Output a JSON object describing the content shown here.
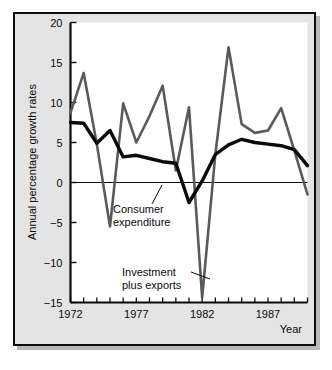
{
  "figure": {
    "background": "#ffffff",
    "panel_background": "#e4e4e4",
    "plot_background": "#ffffff",
    "frame_color": "#0d0d0d"
  },
  "chart_data": {
    "type": "line",
    "title": "",
    "xlabel": "Year",
    "ylabel": "Annual percentage growth rates",
    "xlim": [
      1972,
      1990
    ],
    "ylim": [
      -15,
      20
    ],
    "grid": false,
    "legend": "annotations",
    "yticks": [
      20,
      15,
      10,
      5,
      0,
      -5,
      -10,
      -15
    ],
    "ytick_labels": [
      "20",
      "15",
      "10",
      "5",
      "0",
      "−5",
      "−10",
      "−15"
    ],
    "xticks": [
      1972,
      1973,
      1974,
      1975,
      1976,
      1977,
      1978,
      1979,
      1980,
      1981,
      1982,
      1983,
      1984,
      1985,
      1986,
      1987,
      1988,
      1989,
      1990
    ],
    "xtick_labels": [
      {
        "value": 1972,
        "label": "1972"
      },
      {
        "value": 1977,
        "label": "1977"
      },
      {
        "value": 1982,
        "label": "1982"
      },
      {
        "value": 1987,
        "label": "1987"
      }
    ],
    "zero_line": 0,
    "x": [
      1972,
      1973,
      1974,
      1975,
      1976,
      1977,
      1978,
      1979,
      1980,
      1981,
      1982,
      1983,
      1984,
      1985,
      1986,
      1987,
      1988,
      1989,
      1990
    ],
    "series": [
      {
        "name": "Investment plus exports",
        "color": "#5a5a5a",
        "width": 2.6,
        "values": [
          8.7,
          13.7,
          4.8,
          -5.5,
          9.9,
          5.0,
          8.3,
          12.1,
          1.5,
          9.4,
          -14.4,
          3.5,
          16.9,
          7.3,
          6.2,
          6.5,
          9.3,
          4.0,
          -1.5
        ]
      },
      {
        "name": "Consumer expenditure",
        "color": "#0a0a0a",
        "width": 3.4,
        "values": [
          7.5,
          7.4,
          4.9,
          6.5,
          3.2,
          3.4,
          3.0,
          2.6,
          2.4,
          -2.5,
          0.2,
          3.5,
          4.7,
          5.4,
          5.0,
          4.8,
          4.6,
          4.1,
          2.1
        ]
      }
    ],
    "annotations": [
      {
        "text_line1": "Consumer",
        "text_line2": "expenditure",
        "text_x": 113,
        "text_y": 213,
        "leader": {
          "x1": 152,
          "y1": 204,
          "x2": 162,
          "y2": 185
        }
      },
      {
        "text_line1": "Investment",
        "text_line2": "plus exports",
        "text_x": 122,
        "text_y": 276,
        "leader": {
          "x1": 191,
          "y1": 272,
          "x2": 210,
          "y2": 279
        }
      }
    ]
  },
  "axes": {
    "y_axis_label": "Annual percentage growth rates",
    "x_axis_label": "Year"
  }
}
